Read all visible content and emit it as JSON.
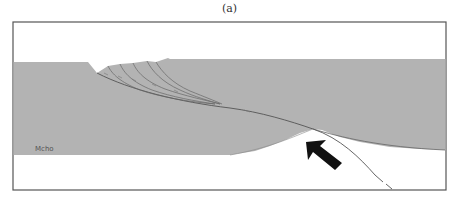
{
  "figure": {
    "caption": "(a)",
    "labels": {
      "moho": "Mcho"
    },
    "colors": {
      "crust_fill": "#b3b3b3",
      "background": "#ffffff",
      "frame": "#555555",
      "fault_line": "#555555",
      "arrow": "#111111"
    },
    "elements": {
      "thrust_sheets_count": 5,
      "arrow_direction": "up-left"
    }
  }
}
